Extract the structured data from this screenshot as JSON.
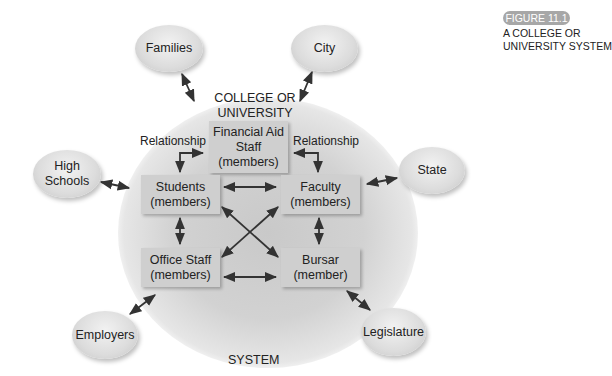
{
  "figure": {
    "badge": "FIGURE 11.1",
    "caption_line1": "A COLLEGE OR",
    "caption_line2": "UNIVERSITY SYSTEM"
  },
  "system": {
    "title_line1": "COLLEGE OR",
    "title_line2": "UNIVERSITY",
    "footer": "SYSTEM",
    "relationship_left": "Relationship",
    "relationship_right": "Relationship"
  },
  "members": {
    "financial_aid": {
      "line1": "Financial Aid",
      "line2": "Staff",
      "line3": "(members)"
    },
    "students": {
      "line1": "Students",
      "line2": "(members)"
    },
    "faculty": {
      "line1": "Faculty",
      "line2": "(members)"
    },
    "office_staff": {
      "line1": "Office Staff",
      "line2": "(members)"
    },
    "bursar": {
      "line1": "Bursar",
      "line2": "(member)"
    }
  },
  "external": {
    "families": "Families",
    "city": "City",
    "high_schools_line1": "High",
    "high_schools_line2": "Schools",
    "state": "State",
    "employers": "Employers",
    "legislature": "Legislature"
  },
  "colors": {
    "box_fill": "#cfcfcf",
    "halo": "#cccccc",
    "ellipse_fill": "#dcdcdc",
    "arrow": "#333333",
    "badge": "#a7a7a7"
  }
}
